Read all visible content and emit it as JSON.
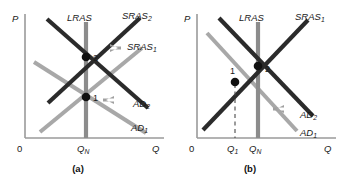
{
  "figure": {
    "type": "economics-diagram",
    "background_color": "#ffffff",
    "colors": {
      "dark_curve": "#2b2b2b",
      "light_curve": "#a8a8a8",
      "lras_line": "#8c8c8c",
      "axis": "#9a9a9a",
      "arrow": "#a0a0a0",
      "text": "#1a1a1a",
      "point_dot": "#111111"
    },
    "panels": [
      {
        "id": "a",
        "caption": "(a)",
        "axes": {
          "y_label": "P",
          "x_label": "Q",
          "origin_label": "0",
          "x_ticks": [
            {
              "label": "Q",
              "sub": "N",
              "x": 86
            }
          ]
        },
        "curves": [
          {
            "name": "LRAS",
            "label": "LRAS",
            "sub": "",
            "shade": "lras"
          },
          {
            "name": "SRAS2",
            "label": "SRAS",
            "sub": "2",
            "shade": "dark"
          },
          {
            "name": "SRAS1",
            "label": "SRAS",
            "sub": "1",
            "shade": "light"
          },
          {
            "name": "AD2",
            "label": "AD",
            "sub": "2",
            "shade": "dark"
          },
          {
            "name": "AD1",
            "label": "AD",
            "sub": "1",
            "shade": "light"
          }
        ],
        "points": [
          {
            "label": "1",
            "x": 86,
            "y": 97
          },
          {
            "label": "2",
            "x": 86,
            "y": 57
          }
        ],
        "arrows": [
          {
            "name": "sras-shift-arrow",
            "direction": "left",
            "meaning": "SRAS shifts left"
          },
          {
            "name": "ad-shift-arrow",
            "direction": "right",
            "meaning": "AD shifts right"
          }
        ]
      },
      {
        "id": "b",
        "caption": "(b)",
        "axes": {
          "y_label": "P",
          "x_label": "Q",
          "origin_label": "0",
          "x_ticks": [
            {
              "label": "Q",
              "sub": "1",
              "x": 63
            },
            {
              "label": "Q",
              "sub": "N",
              "x": 86
            }
          ]
        },
        "curves": [
          {
            "name": "LRAS",
            "label": "LRAS",
            "sub": "",
            "shade": "lras"
          },
          {
            "name": "SRAS1",
            "label": "SRAS",
            "sub": "1",
            "shade": "dark"
          },
          {
            "name": "AD2",
            "label": "AD",
            "sub": "2",
            "shade": "dark"
          },
          {
            "name": "AD1",
            "label": "AD",
            "sub": "1",
            "shade": "light"
          }
        ],
        "points": [
          {
            "label": "1",
            "x": 63,
            "y": 82
          },
          {
            "label": "2",
            "x": 86,
            "y": 66
          }
        ],
        "arrows": [
          {
            "name": "ad-shift-arrow",
            "direction": "right",
            "meaning": "AD shifts right"
          }
        ],
        "guides": [
          {
            "name": "q1-dashed-guide",
            "style": "dashed",
            "from_x": 63
          }
        ]
      }
    ]
  }
}
